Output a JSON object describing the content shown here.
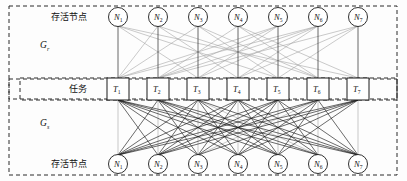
{
  "figure": {
    "kind": "bipartite-task-node-assignment-diagram",
    "background_color": "#fdfdfd",
    "edge_colors": {
      "dark": "#1a1a1a",
      "gray": "#a6a6a6",
      "border": "#2b2b2b"
    }
  },
  "labels": {
    "top_row_label": "存活节点",
    "middle_row_label": "任务",
    "bottom_row_label": "存活节点",
    "upper_graph_name": "G",
    "upper_graph_subscript": "r",
    "lower_graph_name": "G",
    "lower_graph_subscript": "s"
  },
  "top_nodes": [
    {
      "name": "N",
      "sub": "1"
    },
    {
      "name": "N",
      "sub": "2"
    },
    {
      "name": "N",
      "sub": "3"
    },
    {
      "name": "N",
      "sub": "4"
    },
    {
      "name": "N",
      "sub": "5"
    },
    {
      "name": "N",
      "sub": "6"
    },
    {
      "name": "N",
      "sub": "7"
    }
  ],
  "tasks": [
    {
      "name": "T",
      "sub": "1"
    },
    {
      "name": "T",
      "sub": "2"
    },
    {
      "name": "T",
      "sub": "3"
    },
    {
      "name": "T",
      "sub": "4"
    },
    {
      "name": "T",
      "sub": "5"
    },
    {
      "name": "T",
      "sub": "6"
    },
    {
      "name": "T",
      "sub": "7"
    }
  ],
  "bottom_nodes": [
    {
      "name": "N",
      "sub": "1"
    },
    {
      "name": "N",
      "sub": "2"
    },
    {
      "name": "N",
      "sub": "3"
    },
    {
      "name": "N",
      "sub": "4"
    },
    {
      "name": "N",
      "sub": "5"
    },
    {
      "name": "N",
      "sub": "6"
    },
    {
      "name": "N",
      "sub": "7"
    }
  ],
  "graph_data": {
    "type": "bipartite",
    "upper_graph": {
      "name": "G_r",
      "description": "存活节点 to 任务; dark vertical matching edges plus gray crossing candidate edges",
      "matching_edges_dark": [
        [
          1,
          1
        ],
        [
          2,
          2
        ],
        [
          3,
          3
        ],
        [
          4,
          4
        ],
        [
          5,
          5
        ],
        [
          6,
          6
        ],
        [
          7,
          7
        ]
      ],
      "candidate_edges_gray": [
        [
          1,
          3
        ],
        [
          1,
          5
        ],
        [
          1,
          7
        ],
        [
          2,
          4
        ],
        [
          2,
          6
        ],
        [
          2,
          1
        ],
        [
          3,
          5
        ],
        [
          3,
          6
        ],
        [
          3,
          1
        ],
        [
          4,
          2
        ],
        [
          4,
          6
        ],
        [
          4,
          7
        ],
        [
          5,
          2
        ],
        [
          5,
          3
        ],
        [
          5,
          1
        ],
        [
          6,
          1
        ],
        [
          6,
          2
        ],
        [
          6,
          4
        ],
        [
          6,
          3
        ],
        [
          7,
          2
        ],
        [
          7,
          4
        ],
        [
          7,
          5
        ]
      ]
    },
    "lower_graph": {
      "name": "G_s",
      "description": "任务 to 存活节点; dense dark assignment edges plus a few gray edges",
      "edges_dark": [
        [
          1,
          2
        ],
        [
          1,
          3
        ],
        [
          1,
          4
        ],
        [
          1,
          5
        ],
        [
          1,
          6
        ],
        [
          1,
          7
        ],
        [
          2,
          1
        ],
        [
          2,
          3
        ],
        [
          2,
          4
        ],
        [
          2,
          5
        ],
        [
          2,
          6
        ],
        [
          2,
          7
        ],
        [
          3,
          1
        ],
        [
          3,
          2
        ],
        [
          3,
          4
        ],
        [
          3,
          5
        ],
        [
          3,
          7
        ],
        [
          4,
          1
        ],
        [
          4,
          2
        ],
        [
          4,
          3
        ],
        [
          4,
          5
        ],
        [
          4,
          6
        ],
        [
          4,
          7
        ],
        [
          5,
          1
        ],
        [
          5,
          2
        ],
        [
          5,
          3
        ],
        [
          5,
          4
        ],
        [
          5,
          6
        ],
        [
          5,
          7
        ],
        [
          6,
          1
        ],
        [
          6,
          2
        ],
        [
          6,
          4
        ],
        [
          6,
          5
        ],
        [
          6,
          7
        ],
        [
          7,
          1
        ],
        [
          7,
          2
        ],
        [
          7,
          3
        ],
        [
          7,
          4
        ],
        [
          7,
          5
        ]
      ],
      "edges_gray": [
        [
          1,
          1
        ],
        [
          2,
          2
        ],
        [
          3,
          3
        ],
        [
          4,
          4
        ],
        [
          5,
          5
        ],
        [
          6,
          6
        ],
        [
          7,
          7
        ],
        [
          3,
          6
        ],
        [
          6,
          3
        ]
      ]
    }
  }
}
